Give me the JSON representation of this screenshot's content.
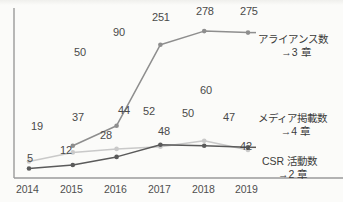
{
  "chart_data": {
    "type": "line",
    "title": "",
    "subtitle": "",
    "xlabel": "",
    "ylabel": "",
    "categories": [
      "2014",
      "2015",
      "2016",
      "2017",
      "2018",
      "2019"
    ],
    "ylim": [
      0,
      300
    ],
    "grid": false,
    "legend_position": "right-inline",
    "axes": "left-and-bottom-only",
    "y_tick_labels": [],
    "series": [
      {
        "name": "アライアンス数",
        "annotation": "→3 章",
        "color": "#8e8e8e",
        "values": [
          null,
          50,
          90,
          251,
          278,
          275
        ],
        "labels": [
          "",
          "50",
          "90",
          "251",
          "278",
          "275"
        ]
      },
      {
        "name": "メディア掲載数",
        "annotation": "→4 章",
        "color": "#c9c9c9",
        "values": [
          19,
          37,
          44,
          48,
          60,
          42
        ],
        "labels": [
          "19",
          "37",
          "44",
          "48",
          "60",
          "42"
        ]
      },
      {
        "name": "CSR 活動数",
        "annotation": "→2 章",
        "color": "#5a5a5a",
        "values": [
          5,
          12,
          28,
          52,
          50,
          47
        ],
        "labels": [
          "5",
          "12",
          "28",
          "52",
          "50",
          "47"
        ]
      }
    ]
  },
  "axis": {
    "color": "#9a9a9a",
    "ticks": [
      {
        "label": "2014",
        "x": 29
      },
      {
        "label": "2015",
        "x": 73
      },
      {
        "label": "2016",
        "x": 117
      },
      {
        "label": "2017",
        "x": 161
      },
      {
        "label": "2018",
        "x": 205
      },
      {
        "label": "2019",
        "x": 248
      }
    ]
  },
  "value_labels": [
    {
      "text": "50",
      "x": 74,
      "y": 47,
      "series": "アライアンス数"
    },
    {
      "text": "90",
      "x": 113,
      "y": 27,
      "series": "アライアンス数"
    },
    {
      "text": "251",
      "x": 152,
      "y": 12,
      "series": "アライアンス数"
    },
    {
      "text": "278",
      "x": 196,
      "y": 6,
      "series": "アライアンス数"
    },
    {
      "text": "275",
      "x": 240,
      "y": 6,
      "series": "アライアンス数"
    },
    {
      "text": "19",
      "x": 31,
      "y": 121,
      "series": "メディア掲載数"
    },
    {
      "text": "37",
      "x": 72,
      "y": 112,
      "series": "メディア掲載数"
    },
    {
      "text": "44",
      "x": 118,
      "y": 105,
      "series": "メディア掲載数"
    },
    {
      "text": "48",
      "x": 158,
      "y": 126,
      "series": "メディア掲載数"
    },
    {
      "text": "60",
      "x": 200,
      "y": 85,
      "series": "メディア掲載数"
    },
    {
      "text": "42",
      "x": 240,
      "y": 141,
      "series": "メディア掲載数"
    },
    {
      "text": "5",
      "x": 27,
      "y": 153,
      "series": "CSR 活動数"
    },
    {
      "text": "12",
      "x": 60,
      "y": 145,
      "series": "CSR 活動数"
    },
    {
      "text": "28",
      "x": 100,
      "y": 130,
      "series": "CSR 活動数"
    },
    {
      "text": "52",
      "x": 143,
      "y": 106,
      "series": "CSR 活動数"
    },
    {
      "text": "50",
      "x": 182,
      "y": 108,
      "series": "CSR 活動数"
    },
    {
      "text": "47",
      "x": 223,
      "y": 112,
      "series": "CSR 活動数"
    }
  ],
  "series_notes": [
    {
      "line1": "アライアンス数",
      "line2": "→3 章",
      "x": 258,
      "y": 33
    },
    {
      "line1": "メディア掲載数",
      "line2": "→4 章",
      "x": 258,
      "y": 112
    },
    {
      "line1": "CSR 活動数",
      "line2": "→2 章",
      "x": 262,
      "y": 155
    }
  ]
}
